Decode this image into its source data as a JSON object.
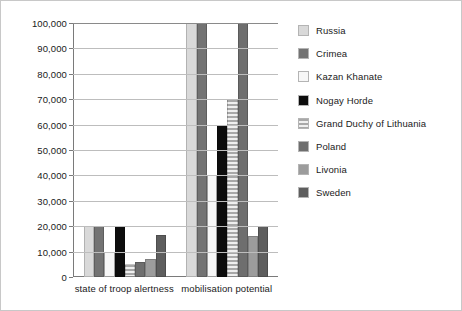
{
  "chart_data": {
    "type": "bar",
    "title": "",
    "subtitle": "",
    "xlabel": "",
    "ylabel": "",
    "ylim": [
      0,
      100000
    ],
    "grid": true,
    "legend_position": "right",
    "categories": [
      "state of troop alertness",
      "mobilisation potential"
    ],
    "y_ticks": [
      {
        "value": 0,
        "label": "0"
      },
      {
        "value": 10000,
        "label": "10,000"
      },
      {
        "value": 20000,
        "label": "20,000"
      },
      {
        "value": 30000,
        "label": "30,000"
      },
      {
        "value": 40000,
        "label": "40,000"
      },
      {
        "value": 50000,
        "label": "50,000"
      },
      {
        "value": 60000,
        "label": "60,000"
      },
      {
        "value": 70000,
        "label": "70,000"
      },
      {
        "value": 80000,
        "label": "80,000"
      },
      {
        "value": 90000,
        "label": "90,000"
      },
      {
        "value": 100000,
        "label": "100,000"
      }
    ],
    "series": [
      {
        "name": "Russia",
        "color": "#d9d9d9",
        "pattern": "solid",
        "values": [
          20000,
          100000
        ]
      },
      {
        "name": "Crimea",
        "color": "#737373",
        "pattern": "solid",
        "values": [
          20000,
          100000
        ]
      },
      {
        "name": "Kazan Khanate",
        "color": "#f7f7f7",
        "pattern": "solid",
        "values": [
          10000,
          40000
        ]
      },
      {
        "name": "Nogay Horde",
        "color": "#0d0d0d",
        "pattern": "solid",
        "values": [
          20000,
          60000
        ]
      },
      {
        "name": "Grand Duchy of Lithuania",
        "color": "#a8a8a8",
        "pattern": "horizontal",
        "values": [
          5000,
          70000
        ]
      },
      {
        "name": "Poland",
        "color": "#6e6e6e",
        "pattern": "solid",
        "values": [
          6000,
          100000
        ]
      },
      {
        "name": "Livonia",
        "color": "#9c9c9c",
        "pattern": "solid",
        "values": [
          7000,
          16000
        ]
      },
      {
        "name": "Sweden",
        "color": "#5e5e5e",
        "pattern": "solid",
        "values": [
          16500,
          20000
        ]
      }
    ]
  },
  "legend": {
    "items": [
      {
        "label": "Russia"
      },
      {
        "label": "Crimea"
      },
      {
        "label": "Kazan Khanate"
      },
      {
        "label": "Nogay Horde"
      },
      {
        "label": "Grand Duchy of Lithuania"
      },
      {
        "label": "Poland"
      },
      {
        "label": "Livonia"
      },
      {
        "label": "Sweden"
      }
    ]
  }
}
